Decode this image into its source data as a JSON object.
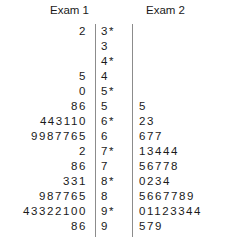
{
  "chart_data": {
    "type": "table",
    "title": "",
    "plot_kind": "back-to-back stem-and-leaf plot",
    "headers": {
      "left": "Exam 1",
      "right": "Exam 2"
    },
    "stems": [
      "3*",
      "3",
      "4*",
      "4",
      "5*",
      "5",
      "6*",
      "6",
      "7*",
      "7",
      "8*",
      "8",
      "9*",
      "9"
    ],
    "left_leaves": [
      "2",
      "",
      "",
      "5",
      "0",
      "86",
      "443110",
      "9987765",
      "2",
      "86",
      "331",
      "987765",
      "43322100",
      "86"
    ],
    "right_leaves": [
      "",
      "",
      "",
      "",
      "",
      "5",
      "23",
      "677",
      "13444",
      "56778",
      "0234",
      "5667789",
      "01123344",
      "579"
    ],
    "rows": [
      {
        "left": "2",
        "stem": "3*",
        "right": ""
      },
      {
        "left": "",
        "stem": "3",
        "right": ""
      },
      {
        "left": "",
        "stem": "4*",
        "right": ""
      },
      {
        "left": "5",
        "stem": "4",
        "right": ""
      },
      {
        "left": "0",
        "stem": "5*",
        "right": ""
      },
      {
        "left": "86",
        "stem": "5",
        "right": "5"
      },
      {
        "left": "443110",
        "stem": "6*",
        "right": "23"
      },
      {
        "left": "9987765",
        "stem": "6",
        "right": "677"
      },
      {
        "left": "2",
        "stem": "7*",
        "right": "13444"
      },
      {
        "left": "86",
        "stem": "7",
        "right": "56778"
      },
      {
        "left": "331",
        "stem": "8*",
        "right": "0234"
      },
      {
        "left": "987765",
        "stem": "8",
        "right": "5667789"
      },
      {
        "left": "43322100",
        "stem": "9*",
        "right": "01123344"
      },
      {
        "left": "86",
        "stem": "9",
        "right": "579"
      }
    ],
    "colors": {
      "background": "#ffffff",
      "text": "#1a1a1a",
      "rule": "#8c8c8c"
    }
  }
}
